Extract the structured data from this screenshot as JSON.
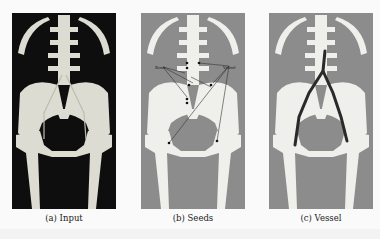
{
  "figure": {
    "panels": [
      {
        "id": "a",
        "caption": "(a) Input",
        "background": "#0e0e0e"
      },
      {
        "id": "b",
        "caption": "(b) Seeds",
        "background": "#8c8c8c",
        "labels": {
          "bone": "Bone",
          "vessel": "Vessel"
        }
      },
      {
        "id": "c",
        "caption": "(c) Vessel",
        "background": "#8c8c8c"
      }
    ]
  }
}
